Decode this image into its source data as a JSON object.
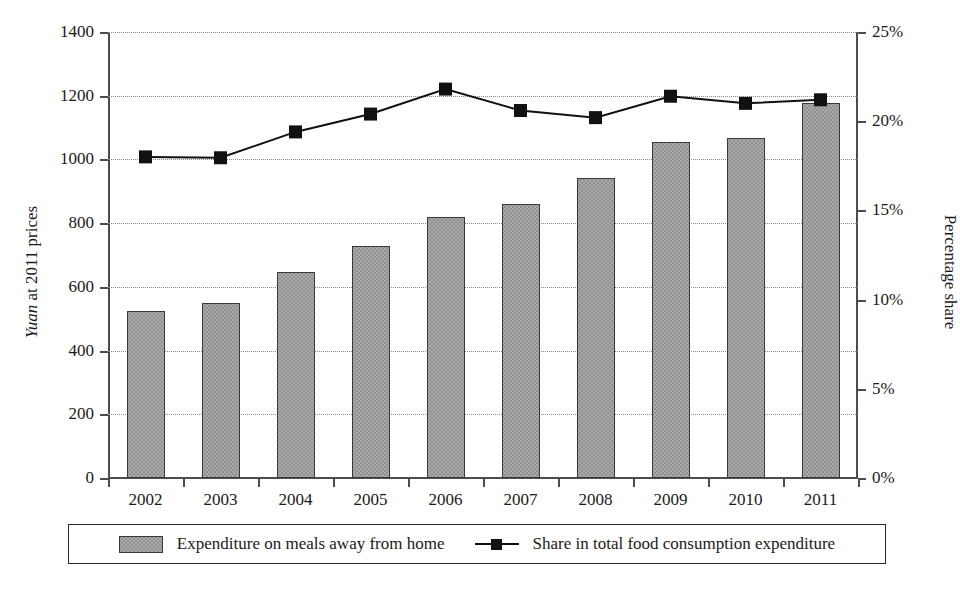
{
  "chart_data": {
    "type": "bar",
    "title": "",
    "categories": [
      "2002",
      "2003",
      "2004",
      "2005",
      "2006",
      "2007",
      "2008",
      "2009",
      "2010",
      "2011"
    ],
    "series": [
      {
        "name": "Expenditure on meals away from home",
        "type": "bar",
        "axis": "left",
        "values": [
          525,
          550,
          648,
          728,
          818,
          860,
          942,
          1055,
          1068,
          1178
        ]
      },
      {
        "name": "Share in total food consumption expenditure",
        "type": "line",
        "axis": "right",
        "values": [
          18.0,
          17.95,
          19.4,
          20.4,
          21.8,
          20.6,
          20.2,
          21.4,
          21.0,
          21.2
        ]
      }
    ],
    "xlabel": "",
    "ylabel_left": "Yuan at 2011 prices",
    "ylabel_left_italic_part": "Yuan",
    "ylabel_left_rest": " at 2011 prices",
    "ylabel_right": "Percentage share",
    "ylim_left": [
      0,
      1400
    ],
    "ylim_right": [
      0,
      25
    ],
    "yticks_left": [
      "0",
      "200",
      "400",
      "600",
      "800",
      "1000",
      "1200",
      "1400"
    ],
    "yticks_left_values": [
      0,
      200,
      400,
      600,
      800,
      1000,
      1200,
      1400
    ],
    "yticks_right": [
      "0%",
      "5%",
      "10%",
      "15%",
      "20%",
      "25%"
    ],
    "yticks_right_values": [
      0,
      5,
      10,
      15,
      20,
      25
    ],
    "grid": true,
    "grid_style": "dotted-horizontal",
    "legend_position": "bottom",
    "colors": {
      "bar_fill": "#ababab",
      "bar_border": "#3a3a3a",
      "line": "#111111",
      "marker": "#111111",
      "axis": "#4d4d4d",
      "grid": "#8c8c8c",
      "text": "#1a1a1a"
    }
  },
  "legend": {
    "items": [
      {
        "label": "Expenditure on meals away from home",
        "marker": "bar-swatch"
      },
      {
        "label": "Share in total food consumption expenditure",
        "marker": "line-marker-swatch"
      }
    ]
  }
}
